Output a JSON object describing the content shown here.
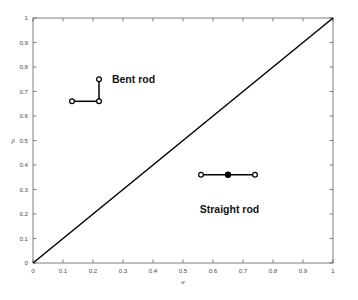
{
  "chart_data": {
    "type": "scatter",
    "title": "",
    "xlabel": "α",
    "ylabel": "β",
    "xlim": [
      0,
      1
    ],
    "ylim": [
      0,
      1
    ],
    "grid": false,
    "legend_position": "inline-annotations",
    "xticks": [
      0,
      0.1,
      0.2,
      0.3,
      0.4,
      0.5,
      0.6,
      0.7,
      0.8,
      0.9,
      1
    ],
    "yticks": [
      0,
      0.1,
      0.2,
      0.3,
      0.4,
      0.5,
      0.6,
      0.7,
      0.8,
      0.9,
      1
    ],
    "xtick_labels": [
      "0",
      "0.1",
      "0.2",
      "0.3",
      "0.4",
      "0.5",
      "0.6",
      "0.7",
      "0.8",
      "0.9",
      "1"
    ],
    "ytick_labels": [
      "0",
      "0.1",
      "0.2",
      "0.3",
      "0.4",
      "0.5",
      "0.6",
      "0.7",
      "0.8",
      "0.9",
      "1"
    ],
    "reference_line": {
      "name": "identity-line",
      "x": [
        0,
        1
      ],
      "y": [
        0,
        1
      ],
      "color": "#000000"
    },
    "series": [
      {
        "name": "Bent rod",
        "label": "Bent rod",
        "label_position": {
          "x": 0.335,
          "y": 0.735
        },
        "marker": "open-circle",
        "color": "#000000",
        "points": [
          {
            "x": 0.13,
            "y": 0.66,
            "marker": "open-circle"
          },
          {
            "x": 0.22,
            "y": 0.66,
            "marker": "open-circle"
          },
          {
            "x": 0.22,
            "y": 0.75,
            "marker": "open-circle"
          }
        ],
        "segments": [
          {
            "x": [
              0.13,
              0.22
            ],
            "y": [
              0.66,
              0.66
            ]
          },
          {
            "x": [
              0.22,
              0.22
            ],
            "y": [
              0.66,
              0.75
            ]
          }
        ]
      },
      {
        "name": "Straight rod",
        "label": "Straight rod",
        "label_position": {
          "x": 0.655,
          "y": 0.205
        },
        "marker": "mixed",
        "color": "#000000",
        "points": [
          {
            "x": 0.56,
            "y": 0.36,
            "marker": "open-circle"
          },
          {
            "x": 0.65,
            "y": 0.36,
            "marker": "filled-circle"
          },
          {
            "x": 0.74,
            "y": 0.36,
            "marker": "open-circle"
          }
        ],
        "segments": [
          {
            "x": [
              0.56,
              0.74
            ],
            "y": [
              0.36,
              0.36
            ]
          }
        ]
      }
    ]
  },
  "colors": {
    "background": "#ffffff",
    "axis": "#5d5d5d",
    "tick_text": "#4a4a4a",
    "data": "#000000",
    "annotation_text": "#141414"
  }
}
